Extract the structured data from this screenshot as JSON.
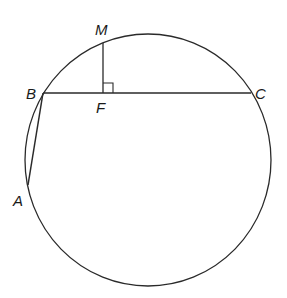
{
  "diagram": {
    "type": "circle-geometry",
    "stroke_color": "#2a2a2a",
    "background": "#ffffff",
    "circle": {
      "cx": 148,
      "cy": 160,
      "rx": 123,
      "ry": 126
    },
    "points": {
      "M": {
        "label": "M",
        "x": 103,
        "y": 43
      },
      "B": {
        "label": "B",
        "x": 43,
        "y": 93
      },
      "F": {
        "label": "F",
        "x": 103,
        "y": 93
      },
      "C": {
        "label": "C",
        "x": 251,
        "y": 93
      },
      "A": {
        "label": "A",
        "x": 28,
        "y": 185
      }
    },
    "segments": [
      {
        "name": "chord-BC",
        "from": "B",
        "to": "C"
      },
      {
        "name": "segment-MF",
        "from": "M",
        "to": "F"
      },
      {
        "name": "chord-AB",
        "from": "A",
        "to": "B"
      }
    ],
    "right_angle_marker": {
      "at": "F",
      "size": 10
    }
  }
}
